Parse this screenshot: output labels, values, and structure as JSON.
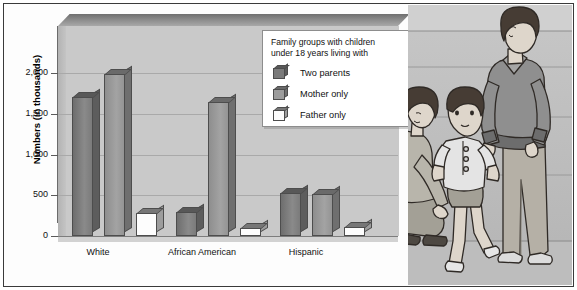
{
  "figure": {
    "background_color": "#ffffff",
    "frame_color": "#3a3a3a",
    "plot_wall_color": "#c9c9c9"
  },
  "chart_data": {
    "type": "bar",
    "title": "",
    "xlabel": "",
    "ylabel": "Numbers (in thousands)",
    "ylim": [
      0,
      2200
    ],
    "yticks": [
      "0",
      "500",
      "1,000",
      "1,500",
      "2,000"
    ],
    "grid": true,
    "legend_position": "upper-right",
    "legend_title": "Family groups with children under 18 years living with",
    "legend_title_line1": "Family groups with children",
    "legend_title_line2": "under 18 years living with",
    "categories": [
      "White",
      "African American",
      "Hispanic"
    ],
    "series": [
      {
        "name": "Two parents",
        "color": "#7b7b7b",
        "values": [
          1700,
          290,
          530
        ]
      },
      {
        "name": "Mother only",
        "color": "#9c9c9c",
        "values": [
          1990,
          1650,
          520
        ]
      },
      {
        "name": "Father only",
        "color": "#ffffff",
        "values": [
          280,
          100,
          110
        ]
      }
    ]
  },
  "illustration": {
    "name": "family-photo-illustration",
    "description": "Illustration of a crouching woman, a toddler walking, and a standing man",
    "skin_color": "#d8d0c6",
    "hair_color": "#4a4038",
    "clothing_color": "#a9a9a9",
    "wall_color": "#c0c0c0"
  }
}
